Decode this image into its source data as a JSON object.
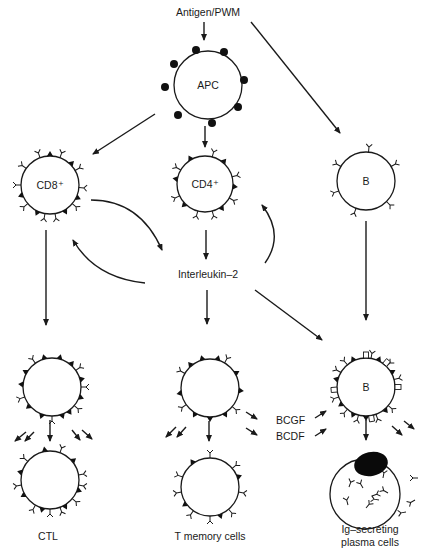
{
  "diagram": {
    "stimulus_label": "Antigen/PWM",
    "nodes": {
      "apc": {
        "label": "APC"
      },
      "cd8": {
        "label": "CD8⁺"
      },
      "cd4": {
        "label": "CD4⁺"
      },
      "b_top": {
        "label": "B"
      },
      "interleukin": {
        "label": "Interleukin–2"
      },
      "b_activated": {
        "label": "B"
      },
      "ctl_label": {
        "label": "CTL"
      },
      "tmem_label": {
        "label": "T memory cells"
      },
      "plasma_label_line1": {
        "label": "Ig–secreting"
      },
      "plasma_label_line2": {
        "label": "plasma cells"
      }
    },
    "factors": {
      "bcgf": "BCGF",
      "bcdf": "BCDF"
    },
    "edges": [
      {
        "from": "Antigen/PWM",
        "to": "APC"
      },
      {
        "from": "Antigen/PWM",
        "to": "B"
      },
      {
        "from": "APC",
        "to": "CD8+"
      },
      {
        "from": "APC",
        "to": "CD4+"
      },
      {
        "from": "CD4+",
        "to": "Interleukin-2"
      },
      {
        "from": "CD8+",
        "to": "Interleukin-2"
      },
      {
        "from": "Interleukin-2",
        "to": "CD8+"
      },
      {
        "from": "Interleukin-2",
        "to": "CD4+"
      },
      {
        "from": "CD8+",
        "to": "CTL"
      },
      {
        "from": "Interleukin-2",
        "to": "T memory cells"
      },
      {
        "from": "Interleukin-2",
        "to": "activated B"
      },
      {
        "from": "B",
        "to": "activated B"
      },
      {
        "from": "activated B",
        "to": "Ig-secreting plasma cells"
      }
    ],
    "colors": {
      "ink": "#1a1a1a",
      "background": "#ffffff"
    }
  }
}
